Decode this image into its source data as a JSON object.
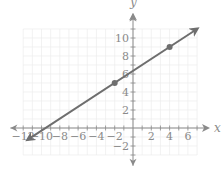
{
  "chart_data": {
    "type": "line",
    "title": "",
    "xlabel": "x",
    "ylabel": "y",
    "xlim": [
      -12,
      7
    ],
    "ylim": [
      -3,
      11
    ],
    "grid": true,
    "x_ticks": [
      -12,
      -10,
      -8,
      -6,
      -4,
      -2,
      2,
      4,
      6
    ],
    "y_ticks": [
      -2,
      2,
      4,
      6,
      8,
      10
    ],
    "x_tick_labels": [
      "−12",
      "−10",
      "−8",
      "−6",
      "−4",
      "−2",
      "2",
      "4",
      "6"
    ],
    "y_tick_labels": [
      "−2",
      "2",
      "4",
      "6",
      "8",
      "10"
    ],
    "series": [
      {
        "name": "line",
        "slope": 0.6667,
        "intercept": 6.333,
        "points": [
          {
            "x": -2,
            "y": 5
          },
          {
            "x": 4,
            "y": 9
          }
        ],
        "endpoints": [
          {
            "x": -11.5,
            "y": -1.3
          },
          {
            "x": 7,
            "y": 11
          }
        ],
        "arrows": "both"
      }
    ],
    "colors": {
      "line": "#6e6e6e",
      "axis": "#8a8a8a",
      "grid": "#ececec",
      "text": "#8a8a8a"
    }
  },
  "labels": {
    "x_axis": "x",
    "y_axis": "y"
  }
}
